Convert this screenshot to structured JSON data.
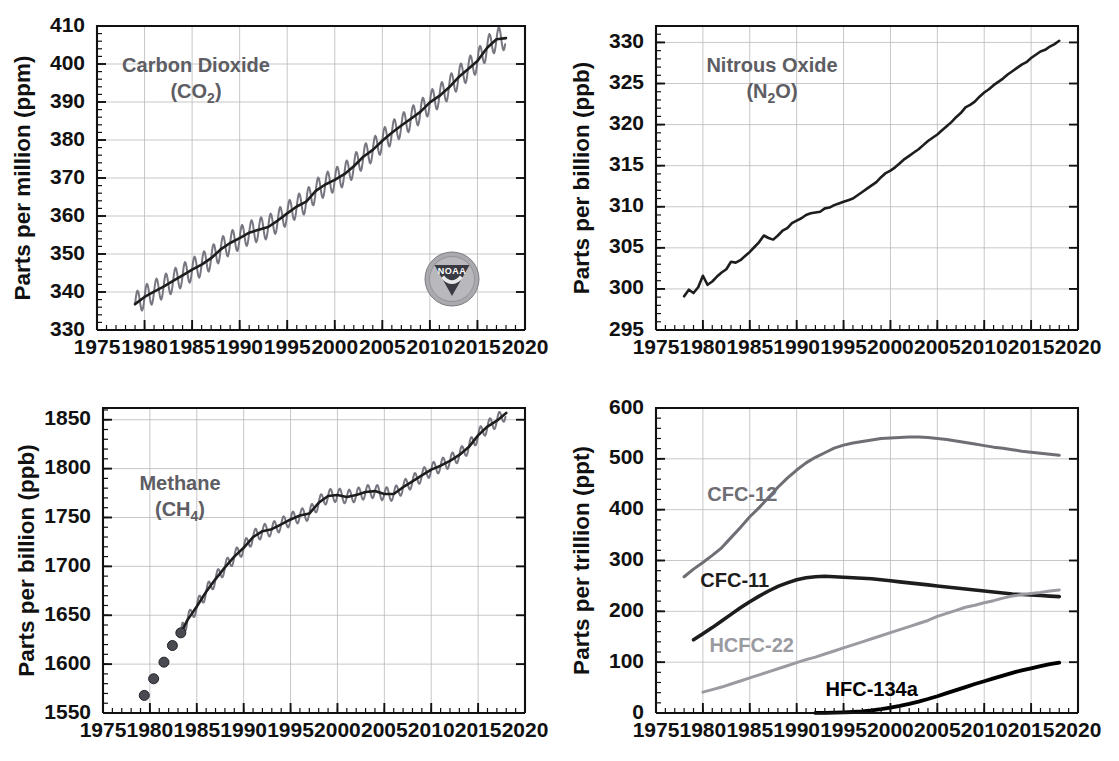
{
  "figure": {
    "panel_count": 4,
    "background": "#ffffff",
    "logo": {
      "name": "NOAA",
      "present_in_panel": "carbon-dioxide"
    }
  },
  "colors": {
    "axis": "#111111",
    "grid": "#b9b9bd",
    "title_gray": "#5d5d63",
    "trend_dark": "#1d1d1d",
    "envelope_gray": "#70707a",
    "cfc12": "#6e6e74",
    "cfc11": "#1d1d1d",
    "hcfc22": "#9a9aa1",
    "hfc134a": "#000000"
  },
  "chart_data": [
    {
      "id": "carbon-dioxide",
      "type": "line",
      "title": "Carbon Dioxide",
      "title_line2": "(CO",
      "title_sub": "2",
      "title_line2_end": ")",
      "formula": "(CO2)",
      "ylabel": "Parts per million (ppm)",
      "xlabel": "",
      "xlim": [
        1975,
        2020
      ],
      "ylim": [
        330,
        410
      ],
      "ytick_step": 10,
      "yminor_step": 2,
      "xtick_step": 5,
      "xminor_step": 1,
      "grid": true,
      "legend": "none",
      "yticks": [
        330,
        340,
        350,
        360,
        370,
        380,
        390,
        400,
        410
      ],
      "xticks": [
        1975,
        1980,
        1985,
        1990,
        1995,
        2000,
        2005,
        2010,
        2015,
        2020
      ],
      "seasonal_amplitude": 3.1,
      "series": [
        {
          "name": "CO2 trend",
          "style": "trend",
          "x": [
            1979.0,
            1980.0,
            1981.0,
            1982.0,
            1983.0,
            1984.0,
            1985.0,
            1986.0,
            1987.0,
            1988.0,
            1989.0,
            1990.0,
            1991.0,
            1992.0,
            1993.0,
            1994.0,
            1995.0,
            1996.0,
            1997.0,
            1998.0,
            1999.0,
            2000.0,
            2001.0,
            2002.0,
            2003.0,
            2004.0,
            2005.0,
            2006.0,
            2007.0,
            2008.0,
            2009.0,
            2010.0,
            2011.0,
            2012.0,
            2013.0,
            2014.0,
            2015.0,
            2016.0,
            2017.0,
            2018.0
          ],
          "y": [
            336.8,
            338.7,
            340.1,
            341.4,
            342.9,
            344.4,
            345.9,
            347.2,
            348.9,
            351.2,
            352.9,
            354.2,
            355.6,
            356.4,
            357.1,
            358.8,
            360.7,
            362.5,
            363.8,
            366.6,
            368.3,
            369.5,
            371.0,
            373.1,
            375.6,
            377.4,
            379.8,
            381.9,
            383.8,
            385.6,
            387.4,
            389.9,
            391.6,
            393.8,
            396.5,
            398.6,
            400.8,
            404.2,
            406.5,
            406.8
          ]
        }
      ]
    },
    {
      "id": "nitrous-oxide",
      "type": "line",
      "title": "Nitrous Oxide",
      "formula": "(N2O)",
      "ylabel": "Parts per billion (ppb)",
      "xlabel": "",
      "xlim": [
        1975,
        2020
      ],
      "ylim": [
        295,
        332
      ],
      "ytick_step": 5,
      "yminor_step": 1,
      "xtick_step": 5,
      "xminor_step": 1,
      "grid": true,
      "legend": "none",
      "yticks": [
        295,
        300,
        305,
        310,
        315,
        320,
        325,
        330
      ],
      "xticks": [
        1975,
        1980,
        1985,
        1990,
        1995,
        2000,
        2005,
        2010,
        2015,
        2020
      ],
      "series": [
        {
          "name": "N2O",
          "style": "solid",
          "x": [
            1978.0,
            1978.5,
            1979.0,
            1979.5,
            1980.0,
            1980.5,
            1981.0,
            1981.5,
            1982.0,
            1982.5,
            1983.0,
            1983.5,
            1984.0,
            1984.5,
            1985.0,
            1985.5,
            1986.0,
            1986.5,
            1987.0,
            1987.5,
            1988.0,
            1988.5,
            1989.0,
            1989.5,
            1990.0,
            1990.5,
            1991.0,
            1991.5,
            1992.0,
            1992.5,
            1993.0,
            1993.5,
            1994.0,
            1994.5,
            1995.0,
            1995.5,
            1996.0,
            1996.5,
            1997.0,
            1997.5,
            1998.0,
            1998.5,
            1999.0,
            1999.5,
            2000.0,
            2000.5,
            2001.0,
            2001.5,
            2002.0,
            2002.5,
            2003.0,
            2003.5,
            2004.0,
            2004.5,
            2005.0,
            2005.5,
            2006.0,
            2006.5,
            2007.0,
            2007.5,
            2008.0,
            2008.5,
            2009.0,
            2009.5,
            2010.0,
            2010.5,
            2011.0,
            2011.5,
            2012.0,
            2012.5,
            2013.0,
            2013.5,
            2014.0,
            2014.5,
            2015.0,
            2015.5,
            2016.0,
            2016.5,
            2017.0,
            2017.5,
            2018.0
          ],
          "y": [
            299.1,
            299.9,
            299.5,
            300.2,
            301.6,
            300.5,
            300.9,
            301.5,
            302.0,
            302.4,
            303.3,
            303.2,
            303.5,
            304.0,
            304.5,
            305.1,
            305.7,
            306.5,
            306.2,
            306.0,
            306.5,
            307.1,
            307.4,
            308.0,
            308.3,
            308.6,
            309.0,
            309.2,
            309.3,
            309.4,
            309.8,
            309.9,
            310.2,
            310.4,
            310.6,
            310.8,
            311.0,
            311.4,
            311.8,
            312.2,
            312.6,
            313.0,
            313.6,
            314.1,
            314.4,
            314.8,
            315.3,
            315.8,
            316.2,
            316.6,
            317.0,
            317.5,
            318.0,
            318.4,
            318.8,
            319.3,
            319.8,
            320.3,
            320.9,
            321.4,
            322.1,
            322.4,
            322.8,
            323.4,
            323.9,
            324.3,
            324.8,
            325.2,
            325.6,
            326.1,
            326.5,
            326.9,
            327.3,
            327.6,
            328.1,
            328.5,
            328.9,
            329.1,
            329.5,
            329.8,
            330.2
          ]
        }
      ]
    },
    {
      "id": "methane",
      "type": "line",
      "title": "Methane",
      "formula": "(CH4)",
      "ylabel": "Parts per billion (ppb)",
      "xlabel": "",
      "xlim": [
        1975,
        2020
      ],
      "ylim": [
        1550,
        1862
      ],
      "ytick_step": 50,
      "yminor_step": 10,
      "xtick_step": 5,
      "xminor_step": 1,
      "grid": true,
      "legend": "none",
      "yticks": [
        1550,
        1600,
        1650,
        1700,
        1750,
        1800,
        1850
      ],
      "xticks": [
        1975,
        1980,
        1985,
        1990,
        1995,
        2000,
        2005,
        2010,
        2015,
        2020
      ],
      "seasonal_amplitude": 7.0,
      "markers": {
        "name": "Early discrete measurements",
        "x": [
          1979.4,
          1980.4,
          1981.5,
          1982.4,
          1983.3
        ],
        "y": [
          1568,
          1585,
          1602,
          1619,
          1632
        ],
        "radius": 5
      },
      "series": [
        {
          "name": "CH4 trend",
          "style": "trend",
          "x": [
            1983.3,
            1984.0,
            1985.0,
            1986.0,
            1987.0,
            1988.0,
            1989.0,
            1990.0,
            1991.0,
            1992.0,
            1993.0,
            1994.0,
            1995.0,
            1996.0,
            1997.0,
            1998.0,
            1999.0,
            2000.0,
            2001.0,
            2002.0,
            2003.0,
            2004.0,
            2005.0,
            2006.0,
            2007.0,
            2008.0,
            2009.0,
            2010.0,
            2011.0,
            2012.0,
            2013.0,
            2014.0,
            2015.0,
            2016.0,
            2017.0,
            2018.0
          ],
          "y": [
            1632,
            1645,
            1659,
            1674,
            1687,
            1699,
            1710,
            1719,
            1730,
            1736,
            1738,
            1743,
            1748,
            1752,
            1754,
            1765,
            1772,
            1773,
            1771,
            1773,
            1776,
            1777,
            1774,
            1774,
            1781,
            1787,
            1793,
            1799,
            1803,
            1808,
            1814,
            1822,
            1834,
            1843,
            1849,
            1857
          ]
        }
      ]
    },
    {
      "id": "halocarbons",
      "type": "line",
      "title": "",
      "formula": "",
      "ylabel": "Parts per trillion (ppt)",
      "xlabel": "",
      "xlim": [
        1975,
        2020
      ],
      "ylim": [
        0,
        600
      ],
      "ytick_step": 100,
      "yminor_step": 20,
      "xtick_step": 5,
      "xminor_step": 1,
      "grid": true,
      "legend": "inline-labels",
      "yticks": [
        0,
        100,
        200,
        300,
        400,
        500,
        600
      ],
      "xticks": [
        1975,
        1980,
        1985,
        1990,
        1995,
        2000,
        2005,
        2010,
        2015,
        2020
      ],
      "series": [
        {
          "name": "CFC-12",
          "color_key": "cfc12",
          "stroke_width": 3.0,
          "label_x": 1984.2,
          "label_y": 418,
          "x": [
            1978.0,
            1979.0,
            1980.0,
            1981.0,
            1982.0,
            1983.0,
            1984.0,
            1985.0,
            1986.0,
            1987.0,
            1988.0,
            1989.0,
            1990.0,
            1991.0,
            1992.0,
            1993.0,
            1994.0,
            1995.0,
            1996.0,
            1997.0,
            1998.0,
            1999.0,
            2000.0,
            2001.0,
            2002.0,
            2003.0,
            2004.0,
            2005.0,
            2006.0,
            2007.0,
            2008.0,
            2009.0,
            2010.0,
            2011.0,
            2012.0,
            2013.0,
            2014.0,
            2015.0,
            2016.0,
            2017.0,
            2018.0
          ],
          "y": [
            268,
            283,
            296,
            310,
            325,
            345,
            365,
            386,
            404,
            424,
            444,
            462,
            478,
            492,
            503,
            512,
            521,
            527,
            531,
            534,
            537,
            540,
            541,
            542,
            543,
            543,
            542,
            540,
            538,
            535,
            532,
            529,
            526,
            523,
            521,
            518,
            515,
            513,
            511,
            509,
            507
          ]
        },
        {
          "name": "CFC-11",
          "color_key": "cfc11",
          "stroke_width": 3.6,
          "label_x": 1983.4,
          "label_y": 247,
          "x": [
            1979.0,
            1980.0,
            1981.0,
            1982.0,
            1983.0,
            1984.0,
            1985.0,
            1986.0,
            1987.0,
            1988.0,
            1989.0,
            1990.0,
            1991.0,
            1992.0,
            1993.0,
            1994.0,
            1995.0,
            1996.0,
            1997.0,
            1998.0,
            1999.0,
            2000.0,
            2001.0,
            2002.0,
            2003.0,
            2004.0,
            2005.0,
            2006.0,
            2007.0,
            2008.0,
            2009.0,
            2010.0,
            2011.0,
            2012.0,
            2013.0,
            2014.0,
            2015.0,
            2016.0,
            2017.0,
            2018.0
          ],
          "y": [
            144,
            156,
            168,
            181,
            194,
            207,
            219,
            230,
            240,
            249,
            256,
            262,
            266,
            268,
            269,
            268,
            267,
            266,
            265,
            264,
            262,
            260,
            258,
            256,
            254,
            252,
            250,
            248,
            246,
            244,
            242,
            240,
            238,
            236,
            234,
            233,
            232,
            231,
            230,
            229
          ]
        },
        {
          "name": "HCFC-22",
          "color_key": "hcfc22",
          "stroke_width": 3.0,
          "label_x": 1985.2,
          "label_y": 120,
          "x": [
            1980.0,
            1981.0,
            1982.0,
            1983.0,
            1984.0,
            1985.0,
            1986.0,
            1987.0,
            1988.0,
            1989.0,
            1990.0,
            1991.0,
            1992.0,
            1993.0,
            1994.0,
            1995.0,
            1996.0,
            1997.0,
            1998.0,
            1999.0,
            2000.0,
            2001.0,
            2002.0,
            2003.0,
            2004.0,
            2005.0,
            2006.0,
            2007.0,
            2008.0,
            2009.0,
            2010.0,
            2011.0,
            2012.0,
            2013.0,
            2014.0,
            2015.0,
            2016.0,
            2017.0,
            2018.0
          ],
          "y": [
            41,
            46,
            51,
            57,
            63,
            69,
            75,
            81,
            87,
            93,
            99,
            105,
            110,
            116,
            122,
            128,
            134,
            140,
            146,
            152,
            158,
            164,
            170,
            176,
            182,
            190,
            196,
            202,
            208,
            212,
            217,
            221,
            226,
            230,
            233,
            235,
            237,
            240,
            242
          ]
        },
        {
          "name": "HFC-134a",
          "color_key": "hfc134a",
          "stroke_width": 3.8,
          "label_x": 1998.0,
          "label_y": 34,
          "x": [
            1992.0,
            1993.0,
            1994.0,
            1995.0,
            1996.0,
            1997.0,
            1998.0,
            1999.0,
            2000.0,
            2001.0,
            2002.0,
            2003.0,
            2004.0,
            2005.0,
            2006.0,
            2007.0,
            2008.0,
            2009.0,
            2010.0,
            2011.0,
            2012.0,
            2013.0,
            2014.0,
            2015.0,
            2016.0,
            2017.0,
            2018.0
          ],
          "y": [
            0.2,
            0.4,
            0.7,
            1.2,
            2.0,
            3.2,
            5.0,
            7.5,
            10.5,
            14.0,
            18.0,
            22.5,
            27.5,
            33.0,
            39.0,
            45.0,
            51.0,
            57.0,
            62.5,
            68.0,
            73.5,
            79.0,
            84.0,
            88.0,
            92.0,
            96.0,
            99.0
          ]
        }
      ]
    }
  ]
}
